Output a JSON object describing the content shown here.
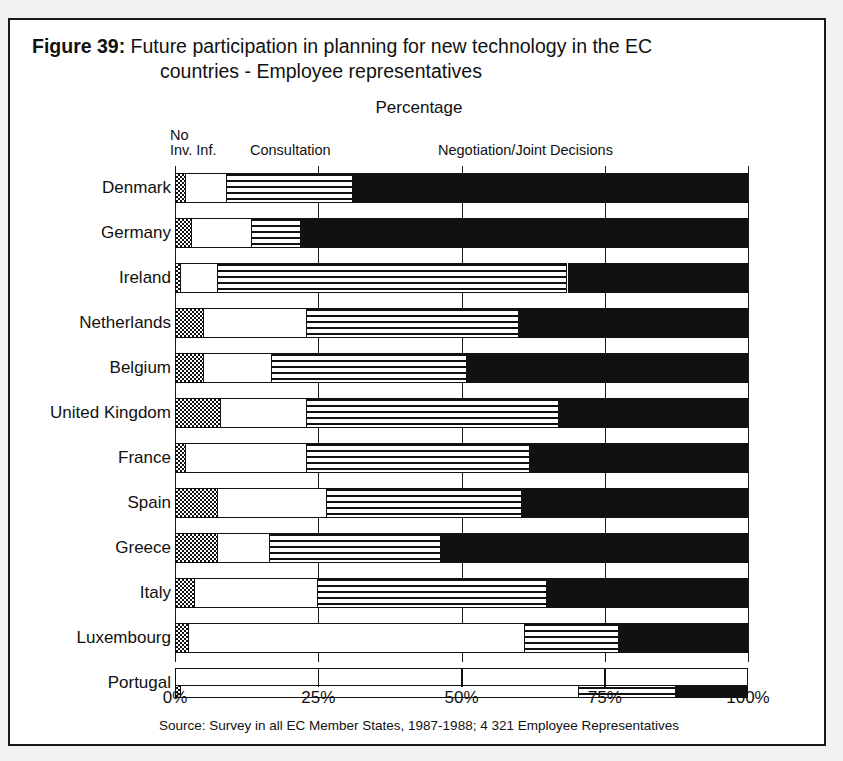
{
  "figure": {
    "label": "Figure 39:",
    "title_line1": "Future participation in planning for new technology in the EC",
    "title_line2": "countries - Employee representatives",
    "axis_title": "Percentage",
    "source": "Source: Survey in all EC Member States, 1987-1988; 4 321 Employee Representatives"
  },
  "legend": {
    "no_line1": "No",
    "no_line2": "Inv. Inf.",
    "consultation": "Consultation",
    "negotiation": "Negotiation/Joint Decisions"
  },
  "colors": {
    "ink": "#111111",
    "paper": "#ffffff",
    "page": "#f2f2f0"
  },
  "chart_data": {
    "type": "bar",
    "orientation": "horizontal",
    "stacked": true,
    "stacked_normalized": true,
    "title": "Figure 39: Future participation in planning for new technology in the EC countries - Employee representatives",
    "xlabel": "Percentage",
    "ylabel": "",
    "xlim": [
      0,
      100
    ],
    "xticks": [
      0,
      25,
      50,
      75,
      100
    ],
    "xticklabels": [
      "0%",
      "25%",
      "50%",
      "75%",
      "100%"
    ],
    "grid": true,
    "legend_position": "top",
    "categories": [
      "Denmark",
      "Germany",
      "Ireland",
      "Netherlands",
      "Belgium",
      "United Kingdom",
      "France",
      "Spain",
      "Greece",
      "Italy",
      "Luxembourg",
      "Portugal"
    ],
    "series": [
      {
        "name": "No",
        "pattern": "dotted",
        "values": [
          2,
          3,
          1,
          5,
          5,
          8,
          2,
          7.5,
          7.5,
          3.5,
          2.5,
          1
        ]
      },
      {
        "name": "Inv. Inf.",
        "pattern": "white",
        "values": [
          7,
          10.5,
          6.5,
          18,
          12,
          15,
          21,
          19,
          9,
          21.5,
          58.5,
          69.5
        ]
      },
      {
        "name": "Consultation",
        "pattern": "horizontal-stripes",
        "values": [
          22,
          8.5,
          61,
          37,
          34,
          44,
          39,
          34,
          30,
          40,
          16.5,
          17
        ]
      },
      {
        "name": "Negotiation/Joint Decisions",
        "pattern": "solid-black",
        "values": [
          69,
          78,
          31.5,
          40,
          49,
          33,
          38,
          39.5,
          53.5,
          35,
          22.5,
          12.5
        ]
      }
    ]
  }
}
